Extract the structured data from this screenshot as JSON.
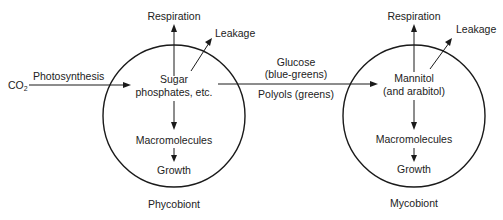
{
  "diagram": {
    "type": "flow",
    "inputs": {
      "co2_label": "CO",
      "co2_subscript": "2",
      "photosynthesis_label": "Photosynthesis"
    },
    "phycobiont": {
      "name": "Phycobiont",
      "respiration": "Respiration",
      "leakage": "Leakage",
      "pool_line1": "Sugar",
      "pool_line2": "phosphates, etc.",
      "macromolecules": "Macromolecules",
      "growth": "Growth"
    },
    "transfer": {
      "line1": "Glucose",
      "line2": "(blue-greens)",
      "line3": "Polyols (greens)"
    },
    "mycobiont": {
      "name": "Mycobiont",
      "respiration": "Respiration",
      "leakage": "Leakage",
      "pool_line1": "Mannitol",
      "pool_line2": "(and arabitol)",
      "macromolecules": "Macromolecules",
      "growth": "Growth"
    },
    "colors": {
      "stroke": "#1a1a1a",
      "text": "#222222",
      "background": "#ffffff"
    }
  }
}
